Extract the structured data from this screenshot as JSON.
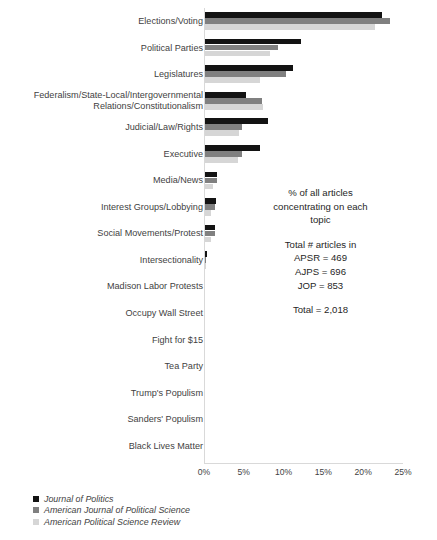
{
  "chart_data": {
    "type": "bar",
    "orientation": "horizontal",
    "title": "",
    "xlabel": "",
    "ylabel": "",
    "xlim": [
      0,
      25
    ],
    "xticks": [
      "0%",
      "5%",
      "10%",
      "15%",
      "20%",
      "25%"
    ],
    "xtick_values": [
      0,
      5,
      10,
      15,
      20,
      25
    ],
    "grid": false,
    "legend_position": "bottom-left",
    "categories": [
      "Elections/Voting",
      "Political Parties",
      "Legislatures",
      "Federalism/State-Local/Intergovernmental\nRelations/Constitutionalism",
      "Judicial/Law/Rights",
      "Executive",
      "Media/News",
      "Interest Groups/Lobbying",
      "Social Movements/Protest",
      "Intersectionality",
      "Madison Labor Protests",
      "Occupy Wall Street",
      "Fight for $15",
      "Tea Party",
      "Trump's Populism",
      "Sanders' Populism",
      "Black Lives Matter"
    ],
    "series": [
      {
        "name": "Journal of Politics",
        "color": "#131313",
        "values": [
          22.2,
          12.0,
          11.1,
          5.2,
          7.9,
          6.9,
          1.5,
          1.4,
          1.3,
          0.2,
          0.0,
          0.0,
          0.0,
          0.0,
          0.0,
          0.0,
          0.0
        ]
      },
      {
        "name": "American Journal of Political Science",
        "color": "#808080",
        "values": [
          23.3,
          9.2,
          10.2,
          7.1,
          4.7,
          4.7,
          1.5,
          1.3,
          1.2,
          0.1,
          0.0,
          0.0,
          0.0,
          0.0,
          0.0,
          0.0,
          0.0
        ]
      },
      {
        "name": "American Political Science Review",
        "color": "#d6d6d6",
        "values": [
          21.3,
          8.2,
          6.9,
          7.3,
          4.3,
          4.2,
          1.0,
          0.8,
          0.8,
          0.1,
          0.0,
          0.0,
          0.0,
          0.0,
          0.0,
          0.0,
          0.0
        ]
      }
    ],
    "annotation_lines": [
      "% of all articles",
      "concentrating on each",
      "topic"
    ],
    "annotation_totals": [
      "Total # articles in",
      "APSR = 469",
      "AJPS = 696",
      "JOP = 853"
    ],
    "annotation_grand_total": "Total = 2,018"
  }
}
